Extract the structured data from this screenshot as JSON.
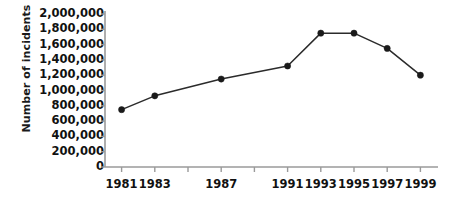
{
  "chart_data": {
    "type": "line",
    "title": "",
    "xlabel": "",
    "ylabel": "Number of incidents",
    "x": [
      1981,
      1983,
      1987,
      1991,
      1993,
      1995,
      1997,
      1999
    ],
    "values": [
      750000,
      930000,
      1150000,
      1320000,
      1750000,
      1750000,
      1550000,
      1200000
    ],
    "series": [
      {
        "name": "Number of incidents",
        "values": [
          750000,
          930000,
          1150000,
          1320000,
          1750000,
          1750000,
          1550000,
          1200000
        ]
      }
    ],
    "ylim": [
      0,
      2000000
    ],
    "xlim": [
      1980,
      2000
    ],
    "y_ticks": [
      0,
      200000,
      400000,
      600000,
      800000,
      1000000,
      1200000,
      1400000,
      1600000,
      1800000,
      2000000
    ],
    "y_tick_labels": [
      "0",
      "200,000",
      "400,000",
      "600,000",
      "800,000",
      "1,000,000",
      "1,200,000",
      "1,400,000",
      "1,600,000",
      "1,800,000",
      "2,000,000"
    ],
    "x_ticks": [
      1981,
      1983,
      1985,
      1987,
      1989,
      1991,
      1993,
      1995,
      1997,
      1999
    ],
    "x_tick_labels": [
      "1981",
      "1983",
      "1987",
      "1991",
      "1993",
      "1995",
      "1997",
      "1999"
    ],
    "x_tick_label_values": [
      1981,
      1983,
      1987,
      1991,
      1993,
      1995,
      1997,
      1999
    ],
    "grid": false,
    "legend": false,
    "legend_position": "none",
    "marker": "filled-circle",
    "line_color": "#2b2b2b",
    "marker_color": "#1a1a1a",
    "axis_color": "#9a9a9a",
    "background_color": "#ffffff",
    "text_color": "#111111"
  }
}
